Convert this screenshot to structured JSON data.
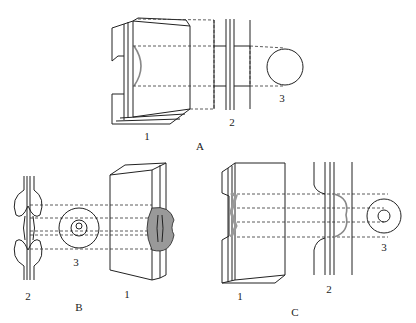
{
  "figure": {
    "panels": [
      {
        "id": "A",
        "label": "A",
        "parts": {
          "block": "1",
          "plate": "2",
          "section": "3"
        }
      },
      {
        "id": "B",
        "label": "B",
        "parts": {
          "block": "1",
          "plate": "2",
          "section": "3"
        }
      },
      {
        "id": "C",
        "label": "C",
        "parts": {
          "block": "1",
          "plate": "2",
          "section": "3"
        }
      }
    ],
    "colors": {
      "line": "#222222",
      "shade": "#888888",
      "background": "#ffffff"
    }
  }
}
